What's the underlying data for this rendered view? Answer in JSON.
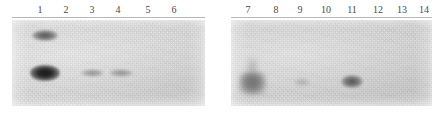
{
  "figure": {
    "type": "gel-blot-autoradiograph",
    "width": 443,
    "height": 117,
    "background_color": "#ffffff",
    "panel_count": 2,
    "lane_count": 14
  },
  "panels": [
    {
      "id": "left-panel",
      "name": "gel-panel-lanes-1-6",
      "x": 12,
      "y": 20,
      "width": 193,
      "height": 86,
      "background_color": "#d6d6d6",
      "rule": {
        "x": 12,
        "y": 17,
        "width": 193
      },
      "lanes": [
        {
          "number": "1",
          "label_x": 40
        },
        {
          "number": "2",
          "label_x": 66
        },
        {
          "number": "3",
          "label_x": 92
        },
        {
          "number": "4",
          "label_x": 118
        },
        {
          "number": "5",
          "label_x": 148
        },
        {
          "number": "6",
          "label_x": 174
        }
      ],
      "bands": [
        {
          "lane": "1",
          "intensity": "medium",
          "x": 32,
          "y": 30,
          "width": 26,
          "height": 11
        },
        {
          "lane": "1",
          "intensity": "strong",
          "x": 30,
          "y": 65,
          "width": 30,
          "height": 16
        },
        {
          "lane": "3",
          "intensity": "faint",
          "x": 81,
          "y": 69,
          "width": 23,
          "height": 8
        },
        {
          "lane": "4",
          "intensity": "faint",
          "x": 109,
          "y": 69,
          "width": 24,
          "height": 8
        }
      ]
    },
    {
      "id": "right-panel",
      "name": "gel-panel-lanes-7-14",
      "x": 231,
      "y": 20,
      "width": 201,
      "height": 86,
      "background_color": "#cfcfcf",
      "rule": {
        "x": 231,
        "y": 17,
        "width": 201
      },
      "lanes": [
        {
          "number": "7",
          "label_x": 248
        },
        {
          "number": "8",
          "label_x": 276
        },
        {
          "number": "9",
          "label_x": 300
        },
        {
          "number": "10",
          "label_x": 326
        },
        {
          "number": "11",
          "label_x": 352
        },
        {
          "number": "12",
          "label_x": 378
        },
        {
          "number": "13",
          "label_x": 402
        },
        {
          "number": "14",
          "label_x": 424
        }
      ],
      "bands": [
        {
          "lane": "7",
          "intensity": "broad",
          "x": 239,
          "y": 72,
          "width": 27,
          "height": 23
        },
        {
          "lane": "7",
          "intensity": "smear",
          "x": 247,
          "y": 58,
          "width": 11,
          "height": 18
        },
        {
          "lane": "9",
          "intensity": "veryfaint",
          "x": 294,
          "y": 78,
          "width": 16,
          "height": 8
        },
        {
          "lane": "11",
          "intensity": "medium",
          "x": 341,
          "y": 75,
          "width": 22,
          "height": 13
        }
      ]
    }
  ]
}
